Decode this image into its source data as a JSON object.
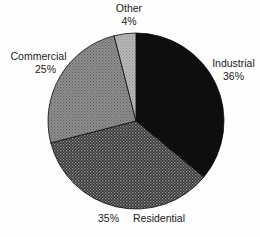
{
  "figure": {
    "background_color": "#fefefe",
    "text_color": "#1b1b1b"
  },
  "chart_data": {
    "type": "pie",
    "title": "",
    "xlabel": "",
    "ylabel": "",
    "legend": "none",
    "start_angle_deg": 0,
    "direction": "clockwise",
    "outline_color": "#0a0a0a",
    "slices": [
      {
        "label": "Industrial",
        "value": 36,
        "value_label": "36%",
        "fill": {
          "style": "solid",
          "bg": "#0e0e0e"
        }
      },
      {
        "label": "Residential",
        "value": 35,
        "value_label": "35%",
        "fill": {
          "style": "dots",
          "bg": "#343434",
          "dot": "#979797",
          "size": 3,
          "dot_size": 1.3
        }
      },
      {
        "label": "Commercial",
        "value": 25,
        "value_label": "25%",
        "fill": {
          "style": "dots",
          "bg": "#909090",
          "dot": "#5e5e5e",
          "size": 3,
          "dot_size": 1.1
        }
      },
      {
        "label": "Other",
        "value": 4,
        "value_label": "4%",
        "fill": {
          "style": "dots",
          "bg": "#b7b7b7",
          "dot": "#929292",
          "size": 3,
          "dot_size": 1.0
        }
      }
    ]
  }
}
